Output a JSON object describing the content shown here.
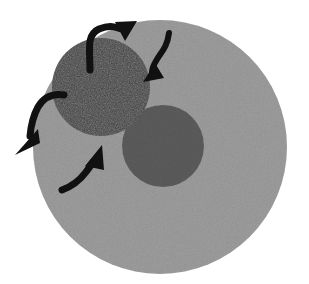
{
  "figure": {
    "title": "",
    "caption": "",
    "background_color": "#ffffff",
    "width": 309,
    "height": 284,
    "style": "grainy grayscale schematic"
  },
  "colors": {
    "outer_circle": "#9e9e9e",
    "dark_circle": "#3b3b3b",
    "medium_circle": "#5c5c5c",
    "arrow": "#111111",
    "background": "#ffffff"
  },
  "shapes": {
    "outer_circle": {
      "name": "large light gray circle",
      "cx": 160,
      "cy": 147,
      "r": 127,
      "fill": "#9e9e9e"
    },
    "dark_circle": {
      "name": "dark gray circle upper left",
      "cx": 101,
      "cy": 87,
      "r": 49,
      "fill": "#3b3b3b"
    },
    "medium_circle": {
      "name": "medium gray circle center right",
      "cx": 163,
      "cy": 146,
      "r": 41,
      "fill": "#5c5c5c"
    }
  },
  "arrows": [
    {
      "id": "arrow-top",
      "label": "top arrow pointing up-right",
      "direction": "up-right",
      "tail_x": 90,
      "tail_y": 70,
      "tip_x": 133,
      "tip_y": 22
    },
    {
      "id": "arrow-upper-right",
      "label": "upper right arrow pointing down-left",
      "direction": "down-left",
      "tail_x": 169,
      "tail_y": 33,
      "tip_x": 148,
      "tip_y": 80
    },
    {
      "id": "arrow-left",
      "label": "left arrow pointing down-left",
      "direction": "down-left",
      "tail_x": 64,
      "tail_y": 95,
      "tip_x": 21,
      "tip_y": 152
    },
    {
      "id": "arrow-bottom",
      "label": "bottom arrow pointing up-right",
      "direction": "up-right",
      "tail_x": 62,
      "tail_y": 190,
      "tip_x": 100,
      "tip_y": 148
    }
  ]
}
